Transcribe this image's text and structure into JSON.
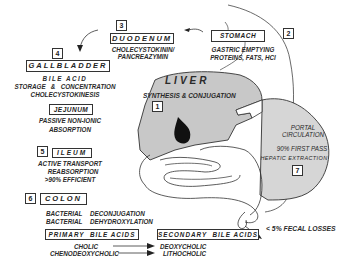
{
  "diagram": {
    "nodes": {
      "stomach": {
        "number": "2",
        "label": "STOMACH",
        "line1": "GASTRIC EMPTYING",
        "line2": "PROTEINS, FATS, HCl"
      },
      "duodenum": {
        "number": "3",
        "label": "DUODENUM",
        "line1": "CHOLECYSTOKININ/",
        "line2": "PANCREAZYMIN"
      },
      "gallbladder": {
        "number": "4",
        "label": "GALLBLADDER",
        "line1": "BILE ACID",
        "line2": "STORAGE   &   CONCENTRATION",
        "line3": "CHOLECYSTOKINESIS"
      },
      "jejunum": {
        "label": "JEJUNUM",
        "line1": "PASSIVE NON-IONIC",
        "line2": "ABSORPTION"
      },
      "ileum": {
        "number": "5",
        "label": "ILEUM",
        "line1": "ACTIVE TRANSPORT",
        "line2": "REABSORPTION",
        "line3": ">90% EFFICIENT"
      },
      "colon": {
        "number": "6",
        "label": "COLON",
        "line1a": "BACTERIAL",
        "line1b": "DECONJUGATION",
        "line2a": "BACTERIAL",
        "line2b": "DEHYDROXYLATION"
      },
      "liver": {
        "number": "1",
        "label": "LIVER",
        "line1": "SYNTHESIS & CONJUGATION"
      },
      "portal": {
        "number": "7",
        "line1": "PORTAL",
        "line2": "CIRCULATION",
        "line3": "90% FIRST PASS",
        "line4": "HEPATIC EXTRACTION"
      },
      "fecal": {
        "label": "< 5% FECAL LOSSES"
      }
    },
    "bile_acids": {
      "primary_label": "PRIMARY  BILE ACIDS",
      "secondary_label": "SECONDARY  BILE ACIDS",
      "primary": [
        "CHOLIC",
        "CHENODEOXYCHOLIC"
      ],
      "secondary": [
        "DEOXYCHOLIC",
        "LITHOCHOLIC"
      ]
    },
    "colors": {
      "organ_fill": "#c8c8c8",
      "gallbladder_fill": "#111111",
      "line": "#333333"
    }
  }
}
